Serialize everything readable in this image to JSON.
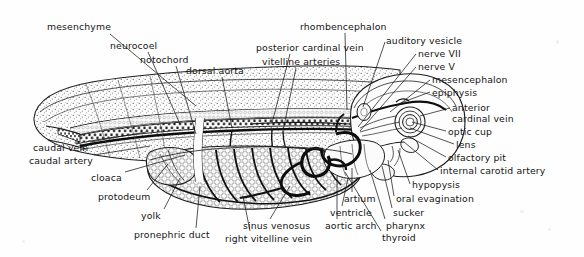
{
  "figure": {
    "background_color": "#fefefe",
    "ink_color": "#1a1a1a",
    "width": 584,
    "height": 257
  },
  "labels": [
    {
      "id": "mesenchyme",
      "text": "mesenchyme",
      "x": 47,
      "y": 22,
      "align": "left",
      "leader": [
        [
          110,
          34
        ],
        [
          196,
          106
        ]
      ]
    },
    {
      "id": "neurocoel",
      "text": "neurocoel",
      "x": 110,
      "y": 41,
      "align": "left",
      "leader": [
        [
          148,
          52
        ],
        [
          180,
          124
        ]
      ]
    },
    {
      "id": "notochord",
      "text": "notochord",
      "x": 140,
      "y": 55,
      "align": "left",
      "leader": [
        [
          176,
          66
        ],
        [
          196,
          134
        ]
      ]
    },
    {
      "id": "dorsal-aorta",
      "text": "dorsal aorta",
      "x": 186,
      "y": 66,
      "align": "left",
      "leader": [
        [
          222,
          77
        ],
        [
          232,
          128
        ]
      ]
    },
    {
      "id": "posterior-cardinal-vein",
      "text": "posterior cardinal vein",
      "x": 256,
      "y": 43,
      "align": "left",
      "leader": [
        [
          290,
          54
        ],
        [
          272,
          123
        ]
      ]
    },
    {
      "id": "vitelline-arteries",
      "text": "vitelline arteries",
      "x": 262,
      "y": 57,
      "align": "left",
      "leader": [
        [
          296,
          68
        ],
        [
          283,
          131
        ]
      ]
    },
    {
      "id": "rhombencephalon",
      "text": "rhombencephalon",
      "x": 300,
      "y": 22,
      "align": "left",
      "leader": [
        [
          345,
          33
        ],
        [
          347,
          110
        ]
      ]
    },
    {
      "id": "auditory-vesicle",
      "text": "auditory vesicle",
      "x": 386,
      "y": 36,
      "align": "left",
      "leader": [
        [
          385,
          42
        ],
        [
          363,
          107
        ]
      ]
    },
    {
      "id": "nerve-vii",
      "text": "nerve VII",
      "x": 418,
      "y": 49,
      "align": "left",
      "leader": [
        [
          416,
          54
        ],
        [
          358,
          127
        ]
      ]
    },
    {
      "id": "nerve-v",
      "text": "nerve V",
      "x": 418,
      "y": 62,
      "align": "left",
      "leader": [
        [
          416,
          67
        ],
        [
          360,
          131
        ]
      ]
    },
    {
      "id": "mesencephalon",
      "text": "mesencephalon",
      "x": 432,
      "y": 75,
      "align": "left",
      "leader": [
        [
          430,
          80
        ],
        [
          390,
          112
        ]
      ]
    },
    {
      "id": "epiphysis",
      "text": "epiphysis",
      "x": 432,
      "y": 88,
      "align": "left",
      "leader": [
        [
          430,
          92
        ],
        [
          398,
          104
        ]
      ]
    },
    {
      "id": "anterior-cardinal-vein",
      "text": "anterior",
      "x": 452,
      "y": 103,
      "align": "left",
      "leader": [
        [
          450,
          108
        ],
        [
          420,
          116
        ]
      ]
    },
    {
      "id": "anterior-cardinal-vein2",
      "text": "cardinal vein",
      "x": 452,
      "y": 114,
      "align": "left",
      "leader": null
    },
    {
      "id": "optic-cup",
      "text": "optic cup",
      "x": 448,
      "y": 127,
      "align": "left",
      "leader": [
        [
          446,
          131
        ],
        [
          412,
          122
        ]
      ]
    },
    {
      "id": "lens",
      "text": "lens",
      "x": 456,
      "y": 140,
      "align": "left",
      "leader": [
        [
          454,
          144
        ],
        [
          410,
          128
        ]
      ]
    },
    {
      "id": "olfactory-pit",
      "text": "olfactory pit",
      "x": 448,
      "y": 153,
      "align": "left",
      "leader": [
        [
          446,
          157
        ],
        [
          408,
          136
        ]
      ]
    },
    {
      "id": "internal-carotid-artery",
      "text": "internal carotid artery",
      "x": 440,
      "y": 166,
      "align": "left",
      "leader": [
        [
          438,
          170
        ],
        [
          404,
          142
        ]
      ]
    },
    {
      "id": "hypopysis",
      "text": "hypopysis",
      "x": 412,
      "y": 180,
      "align": "left",
      "leader": [
        [
          410,
          184
        ],
        [
          398,
          150
        ]
      ]
    },
    {
      "id": "oral-evagination",
      "text": "oral evagination",
      "x": 396,
      "y": 194,
      "align": "left",
      "leader": [
        [
          394,
          196
        ],
        [
          388,
          160
        ]
      ]
    },
    {
      "id": "sucker",
      "text": "sucker",
      "x": 393,
      "y": 208,
      "align": "left",
      "leader": [
        [
          392,
          208
        ],
        [
          382,
          166
        ]
      ]
    },
    {
      "id": "pharynx",
      "text": "pharynx",
      "x": 386,
      "y": 221,
      "align": "left",
      "leader": [
        [
          385,
          219
        ],
        [
          370,
          170
        ]
      ]
    },
    {
      "id": "thyroid",
      "text": "thyroid",
      "x": 382,
      "y": 233,
      "align": "left",
      "leader": [
        [
          381,
          231
        ],
        [
          345,
          172
        ]
      ]
    },
    {
      "id": "aortic-arch",
      "text": "aortic arch",
      "x": 325,
      "y": 221,
      "align": "left",
      "leader": [
        [
          337,
          219
        ],
        [
          337,
          176
        ]
      ]
    },
    {
      "id": "ventricle",
      "text": "ventricle",
      "x": 330,
      "y": 208,
      "align": "left",
      "leader": [
        [
          342,
          206
        ],
        [
          348,
          178
        ]
      ]
    },
    {
      "id": "artium",
      "text": "artium",
      "x": 344,
      "y": 194,
      "align": "left",
      "leader": [
        [
          352,
          192
        ],
        [
          352,
          168
        ]
      ]
    },
    {
      "id": "sinus-venosus",
      "text": "sinus venosus",
      "x": 243,
      "y": 221,
      "align": "left",
      "leader": [
        [
          270,
          219
        ],
        [
          290,
          186
        ]
      ]
    },
    {
      "id": "right-vitelline-vein",
      "text": "right vitelline vein",
      "x": 225,
      "y": 234,
      "align": "left",
      "leader": [
        [
          250,
          231
        ],
        [
          243,
          196
        ]
      ]
    },
    {
      "id": "pronephric-duct",
      "text": "pronephric duct",
      "x": 134,
      "y": 230,
      "align": "left",
      "leader": [
        [
          196,
          228
        ],
        [
          200,
          186
        ]
      ]
    },
    {
      "id": "yolk",
      "text": "yolk",
      "x": 141,
      "y": 211,
      "align": "left",
      "leader": [
        [
          164,
          209
        ],
        [
          180,
          178
        ]
      ]
    },
    {
      "id": "protodeum",
      "text": "protodeum",
      "x": 98,
      "y": 192,
      "align": "left",
      "leader": [
        [
          147,
          190
        ],
        [
          168,
          164
        ]
      ]
    },
    {
      "id": "cloaca",
      "text": "cloaca",
      "x": 91,
      "y": 173,
      "align": "left",
      "leader": [
        [
          125,
          172
        ],
        [
          185,
          155
        ]
      ]
    },
    {
      "id": "caudal-artery",
      "text": "caudal artery",
      "x": 29,
      "y": 156,
      "align": "left",
      "leader": [
        [
          94,
          155
        ],
        [
          150,
          146
        ]
      ]
    },
    {
      "id": "caudal-vein",
      "text": "caudal vein",
      "x": 33,
      "y": 143,
      "align": "left",
      "leader": [
        [
          90,
          142
        ],
        [
          146,
          132
        ]
      ]
    }
  ]
}
